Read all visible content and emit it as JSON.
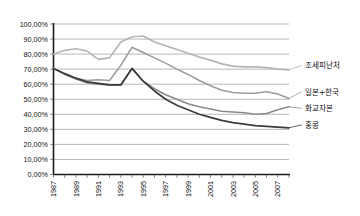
{
  "chart_data": {
    "type": "line",
    "title": "",
    "xlabel": "",
    "ylabel": "",
    "ylim": [
      0,
      100
    ],
    "xlim": [
      1987,
      2008
    ],
    "grid": true,
    "legend_position": "right-inline-labels",
    "y_tick_labels": [
      "100,00%",
      "90,00%",
      "80,00%",
      "70,00%",
      "60,00%",
      "50,00%",
      "40,00%",
      "30,00%",
      "20,00%",
      "10,00%",
      "0,00%"
    ],
    "y_tick_values": [
      100,
      90,
      80,
      70,
      60,
      50,
      40,
      30,
      20,
      10,
      0
    ],
    "x_tick_labels": [
      "1987",
      "1989",
      "1991",
      "1993",
      "1995",
      "1997",
      "1999",
      "2001",
      "2003",
      "2005",
      "2007"
    ],
    "x_tick_values": [
      1987,
      1989,
      1991,
      1993,
      1995,
      1997,
      1999,
      2001,
      2003,
      2005,
      2007
    ],
    "x": [
      1987,
      1988,
      1989,
      1990,
      1991,
      1992,
      1993,
      1994,
      1995,
      1996,
      1997,
      1998,
      1999,
      2000,
      2001,
      2002,
      2003,
      2004,
      2005,
      2006,
      2007,
      2008
    ],
    "series": [
      {
        "name": "조세피난처",
        "label": "조세피난처",
        "color": "#b5b5b5",
        "width": 1.6,
        "values": [
          80.0,
          82.5,
          83.5,
          82.0,
          76.5,
          77.5,
          88.0,
          91.5,
          92.0,
          88.0,
          85.5,
          83.0,
          80.5,
          78.0,
          76.0,
          73.5,
          72.0,
          71.5,
          71.5,
          71.0,
          70.0,
          69.5
        ],
        "label_x": 2009.3,
        "label_y": 72.5
      },
      {
        "name": "일본+한국",
        "label": "일본+한국",
        "color": "#9d9d9d",
        "width": 1.6,
        "values": [
          70.5,
          67.0,
          64.0,
          62.5,
          63.0,
          62.5,
          72.5,
          84.5,
          81.0,
          77.5,
          74.0,
          70.0,
          66.5,
          62.5,
          59.0,
          56.0,
          54.5,
          54.0,
          54.0,
          55.0,
          53.5,
          50.5
        ],
        "label_x": 2009.3,
        "label_y": 55.0
      },
      {
        "name": "화교자본",
        "label": "화교자본",
        "color": "#8a8a8a",
        "width": 1.6,
        "values": [
          70.5,
          66.5,
          63.5,
          61.0,
          60.0,
          59.5,
          59.5,
          70.5,
          62.0,
          57.0,
          53.0,
          50.0,
          47.0,
          45.0,
          43.5,
          42.0,
          41.5,
          41.0,
          40.0,
          40.5,
          43.0,
          45.0
        ],
        "label_x": 2009.3,
        "label_y": 44.0
      },
      {
        "name": "홍콩",
        "label": "홍콩",
        "color": "#3c3c3c",
        "width": 1.7,
        "values": [
          70.5,
          67.0,
          64.0,
          61.5,
          60.5,
          59.5,
          59.5,
          70.5,
          62.0,
          55.5,
          50.0,
          46.0,
          43.0,
          40.0,
          38.0,
          36.0,
          34.5,
          33.5,
          32.5,
          32.0,
          31.5,
          31.0
        ],
        "label_x": 2009.3,
        "label_y": 33.0
      }
    ]
  }
}
